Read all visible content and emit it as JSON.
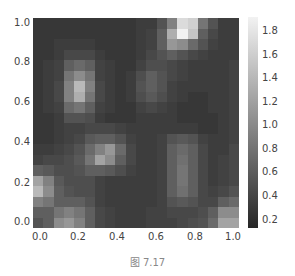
{
  "chart_data": {
    "type": "heatmap",
    "title": "",
    "caption": "图 7.17",
    "xlabel": "",
    "ylabel": "",
    "colormap": "gray",
    "xlim": [
      0.0,
      1.0
    ],
    "ylim": [
      0.0,
      1.0
    ],
    "x_ticks": [
      "0.0",
      "0.2",
      "0.4",
      "0.6",
      "0.8",
      "1.0"
    ],
    "y_ticks": [
      "1.0",
      "0.8",
      "0.6",
      "0.4",
      "0.2",
      "0.0"
    ],
    "colorbar": {
      "min": 0.1,
      "max": 1.9,
      "ticks": [
        "1.8",
        "1.6",
        "1.4",
        "1.2",
        "1.0",
        "0.8",
        "0.6",
        "0.4",
        "0.2"
      ]
    },
    "grid_rows_top_to_bottom": [
      [
        0.25,
        0.25,
        0.25,
        0.25,
        0.25,
        0.25,
        0.25,
        0.25,
        0.25,
        0.25,
        0.3,
        0.3,
        0.5,
        0.9,
        1.7,
        1.6,
        0.8,
        0.5,
        0.3,
        0.3
      ],
      [
        0.25,
        0.25,
        0.25,
        0.25,
        0.25,
        0.25,
        0.25,
        0.25,
        0.25,
        0.25,
        0.3,
        0.35,
        0.6,
        1.3,
        1.9,
        1.5,
        0.6,
        0.4,
        0.3,
        0.3
      ],
      [
        0.25,
        0.25,
        0.3,
        0.3,
        0.3,
        0.3,
        0.25,
        0.25,
        0.25,
        0.25,
        0.3,
        0.35,
        0.6,
        1.1,
        1.0,
        0.7,
        0.5,
        0.35,
        0.3,
        0.3
      ],
      [
        0.25,
        0.25,
        0.3,
        0.4,
        0.4,
        0.4,
        0.3,
        0.25,
        0.25,
        0.25,
        0.3,
        0.4,
        0.5,
        0.6,
        0.5,
        0.4,
        0.35,
        0.3,
        0.3,
        0.3
      ],
      [
        0.25,
        0.3,
        0.35,
        0.6,
        0.7,
        0.6,
        0.35,
        0.3,
        0.25,
        0.25,
        0.35,
        0.45,
        0.45,
        0.4,
        0.35,
        0.3,
        0.3,
        0.3,
        0.3,
        0.35
      ],
      [
        0.25,
        0.3,
        0.35,
        0.8,
        1.0,
        0.8,
        0.35,
        0.3,
        0.25,
        0.3,
        0.45,
        0.6,
        0.5,
        0.4,
        0.35,
        0.3,
        0.3,
        0.3,
        0.3,
        0.35
      ],
      [
        0.25,
        0.3,
        0.4,
        0.9,
        1.4,
        0.9,
        0.4,
        0.3,
        0.25,
        0.3,
        0.5,
        0.6,
        0.5,
        0.35,
        0.3,
        0.3,
        0.3,
        0.3,
        0.3,
        0.35
      ],
      [
        0.25,
        0.3,
        0.4,
        0.9,
        1.3,
        0.8,
        0.4,
        0.3,
        0.25,
        0.3,
        0.45,
        0.55,
        0.45,
        0.35,
        0.3,
        0.25,
        0.25,
        0.3,
        0.3,
        0.35
      ],
      [
        0.25,
        0.3,
        0.35,
        0.7,
        0.8,
        0.6,
        0.35,
        0.3,
        0.25,
        0.25,
        0.35,
        0.4,
        0.35,
        0.3,
        0.25,
        0.25,
        0.25,
        0.3,
        0.3,
        0.35
      ],
      [
        0.25,
        0.25,
        0.3,
        0.5,
        0.5,
        0.45,
        0.3,
        0.25,
        0.25,
        0.25,
        0.3,
        0.3,
        0.3,
        0.3,
        0.25,
        0.25,
        0.25,
        0.25,
        0.3,
        0.35
      ],
      [
        0.25,
        0.25,
        0.3,
        0.35,
        0.35,
        0.4,
        0.4,
        0.4,
        0.35,
        0.3,
        0.3,
        0.3,
        0.3,
        0.3,
        0.3,
        0.3,
        0.25,
        0.25,
        0.3,
        0.35
      ],
      [
        0.25,
        0.25,
        0.3,
        0.35,
        0.4,
        0.55,
        0.6,
        0.6,
        0.5,
        0.35,
        0.3,
        0.3,
        0.35,
        0.5,
        0.55,
        0.5,
        0.35,
        0.3,
        0.3,
        0.35
      ],
      [
        0.3,
        0.3,
        0.35,
        0.4,
        0.5,
        0.7,
        0.9,
        1.1,
        0.7,
        0.4,
        0.3,
        0.3,
        0.35,
        0.6,
        0.7,
        0.6,
        0.4,
        0.3,
        0.3,
        0.4
      ],
      [
        0.35,
        0.4,
        0.4,
        0.45,
        0.55,
        0.8,
        1.2,
        1.0,
        0.6,
        0.4,
        0.3,
        0.3,
        0.35,
        0.6,
        0.75,
        0.6,
        0.4,
        0.3,
        0.35,
        0.4
      ],
      [
        0.6,
        0.55,
        0.45,
        0.45,
        0.5,
        0.6,
        0.6,
        0.55,
        0.45,
        0.35,
        0.3,
        0.3,
        0.35,
        0.6,
        0.8,
        0.6,
        0.4,
        0.3,
        0.35,
        0.4
      ],
      [
        1.2,
        0.9,
        0.55,
        0.45,
        0.45,
        0.45,
        0.35,
        0.3,
        0.3,
        0.3,
        0.3,
        0.3,
        0.35,
        0.6,
        0.8,
        0.6,
        0.4,
        0.3,
        0.35,
        0.4
      ],
      [
        1.4,
        1.0,
        0.6,
        0.5,
        0.45,
        0.45,
        0.35,
        0.3,
        0.3,
        0.3,
        0.3,
        0.3,
        0.35,
        0.6,
        0.75,
        0.6,
        0.4,
        0.35,
        0.4,
        0.5
      ],
      [
        0.9,
        0.8,
        0.6,
        0.6,
        0.6,
        0.5,
        0.35,
        0.3,
        0.3,
        0.3,
        0.3,
        0.3,
        0.35,
        0.5,
        0.55,
        0.5,
        0.4,
        0.4,
        0.6,
        0.7
      ],
      [
        0.6,
        0.6,
        0.8,
        0.9,
        0.8,
        0.6,
        0.4,
        0.35,
        0.3,
        0.3,
        0.3,
        0.35,
        0.35,
        0.4,
        0.4,
        0.4,
        0.45,
        0.6,
        1.0,
        1.0
      ],
      [
        0.5,
        0.6,
        1.0,
        1.1,
        0.9,
        0.6,
        0.4,
        0.35,
        0.3,
        0.3,
        0.3,
        0.35,
        0.35,
        0.35,
        0.4,
        0.45,
        0.5,
        0.7,
        1.2,
        1.2
      ]
    ]
  },
  "axes": {
    "y_tick_positions_px": [
      23,
      62,
      102,
      142,
      183,
      222
    ],
    "x_tick_positions_px": [
      40,
      78,
      117,
      156,
      195,
      233
    ],
    "colorbar_tick_positions_px": [
      31,
      55,
      78,
      102,
      125,
      149,
      172,
      196,
      220
    ]
  }
}
